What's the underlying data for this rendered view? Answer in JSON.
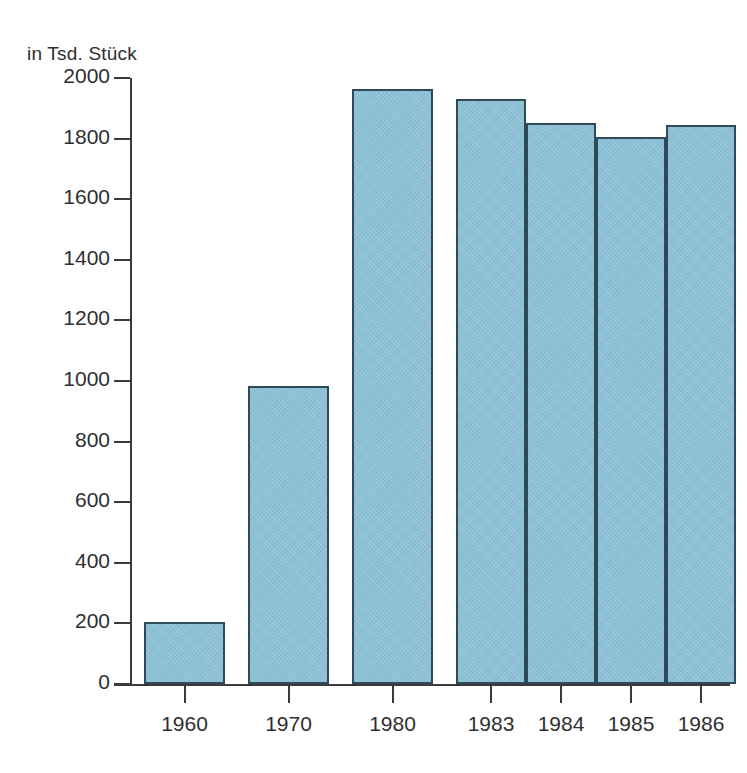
{
  "chart_data": {
    "type": "bar",
    "title": "",
    "subtitle": "",
    "unit_caption": "in Tsd. Stück",
    "xlabel": "",
    "ylabel": "",
    "categories": [
      "1960",
      "1970",
      "1980",
      "1983",
      "1984",
      "1985",
      "1986"
    ],
    "values": [
      205,
      985,
      1965,
      1930,
      1850,
      1805,
      1845
    ],
    "series": [
      {
        "name": "in Tsd. Stück",
        "values": [
          205,
          985,
          1965,
          1930,
          1850,
          1805,
          1845
        ]
      }
    ],
    "ylim": [
      0,
      2000
    ],
    "yticks": [
      0,
      200,
      400,
      600,
      800,
      1000,
      1200,
      1400,
      1600,
      1800,
      2000
    ],
    "ytick_labels": [
      "0",
      "200",
      "400",
      "600",
      "800",
      "1000",
      "1200",
      "1400",
      "1600",
      "1800",
      "2000"
    ],
    "grid": false,
    "legend": false,
    "legend_position": "none",
    "bar_fill_color": "#8cc0d4",
    "bar_edge_color": "#2e4a58",
    "axis_color": "#3a3a3a",
    "text_color": "#2f2f2f",
    "background_color": "#ffffff",
    "annotations": []
  }
}
